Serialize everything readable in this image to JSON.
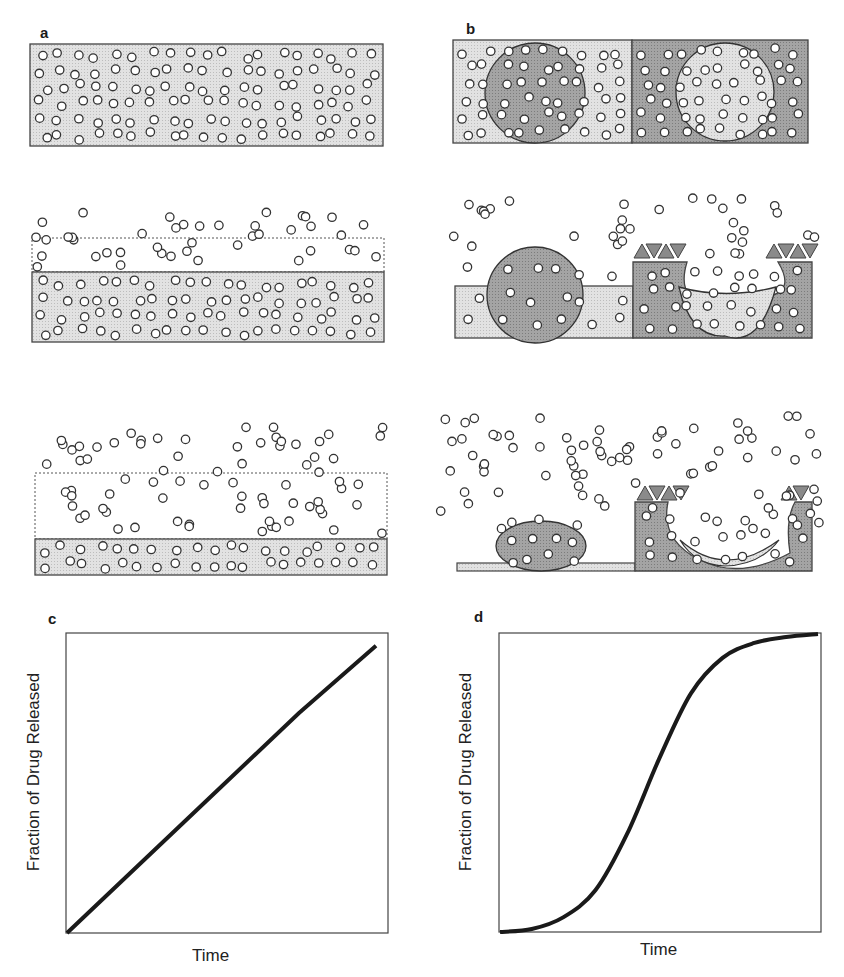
{
  "figure": {
    "panels": [
      {
        "id": "a",
        "label": "a",
        "description": "Matrix (slab) erosion: drug particles dispersed in uniform matrix; matrix surface erodes over three stages releasing drug"
      },
      {
        "id": "b",
        "label": "b",
        "description": "Heterogeneous device: spherical domains in two matrix types erode; triangular cap coatings; three stages"
      },
      {
        "id": "c",
        "label": "c"
      },
      {
        "id": "d",
        "label": "d"
      }
    ],
    "colors": {
      "matrix_light": "#dcdcdc",
      "matrix_dark": "#9a9a9a",
      "particle_fill": "#ffffff",
      "particle_stroke": "#333333",
      "curve": "#1a1a1a",
      "frame": "#333333"
    }
  },
  "chart_data": [
    {
      "type": "line",
      "panel": "c",
      "title": "",
      "xlabel": "Time",
      "ylabel": "Fraction of Drug Released",
      "grid": false,
      "legend": null,
      "x": [
        0,
        0.25,
        0.5,
        0.75,
        1.0
      ],
      "series": [
        {
          "name": "zero-order release",
          "values": [
            0,
            0.25,
            0.5,
            0.75,
            0.98
          ]
        }
      ],
      "xlim": [
        0,
        1
      ],
      "ylim": [
        0,
        1
      ],
      "ticks": "none"
    },
    {
      "type": "line",
      "panel": "d",
      "title": "",
      "xlabel": "Time",
      "ylabel": "Fraction of Drug Released",
      "grid": false,
      "legend": null,
      "x": [
        0,
        0.1,
        0.2,
        0.3,
        0.4,
        0.5,
        0.6,
        0.7,
        0.8,
        0.9,
        1.0
      ],
      "series": [
        {
          "name": "sigmoidal release",
          "values": [
            0,
            0.01,
            0.05,
            0.14,
            0.33,
            0.58,
            0.8,
            0.92,
            0.97,
            0.99,
            1.0
          ]
        }
      ],
      "xlim": [
        0,
        1
      ],
      "ylim": [
        0,
        1
      ],
      "ticks": "none"
    }
  ]
}
